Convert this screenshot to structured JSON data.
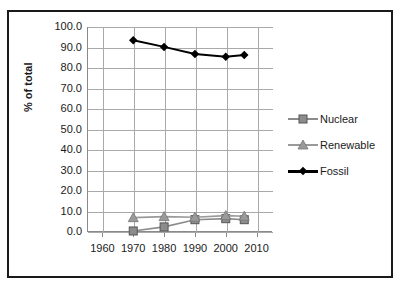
{
  "chart_data": {
    "type": "line",
    "title": "",
    "subtitle": "",
    "xlabel": "",
    "ylabel": "% of total",
    "x": [
      1970,
      1980,
      1990,
      2000,
      2006
    ],
    "xlim": [
      1955,
      2015
    ],
    "ylim": [
      0.0,
      100.0
    ],
    "xticks": [
      1960,
      1970,
      1980,
      1990,
      2000,
      2010
    ],
    "xtick_labels": [
      "1960",
      "1970",
      "1980",
      "1990",
      "2000",
      "2010"
    ],
    "yticks": [
      0.0,
      10.0,
      20.0,
      30.0,
      40.0,
      50.0,
      60.0,
      70.0,
      80.0,
      90.0,
      100.0
    ],
    "ytick_labels": [
      "0.0",
      "10.0",
      "20.0",
      "30.0",
      "40.0",
      "50.0",
      "60.0",
      "70.0",
      "80.0",
      "90.0",
      "100.0"
    ],
    "grid": true,
    "grid_axis": "both",
    "legend_position": "right",
    "series": [
      {
        "name": "Nuclear",
        "marker": "square",
        "color": "#8c8c8c",
        "line_color": "#8c8c8c",
        "values": [
          0.5,
          2.5,
          6.0,
          6.5,
          6.0
        ]
      },
      {
        "name": "Renewable",
        "marker": "triangle",
        "color": "#9a9a9a",
        "line_color": "#9a9a9a",
        "values": [
          7.0,
          7.5,
          7.2,
          8.0,
          7.7
        ]
      },
      {
        "name": "Fossil",
        "marker": "diamond",
        "color": "#000000",
        "line_color": "#000000",
        "values": [
          93.5,
          90.3,
          86.8,
          85.5,
          86.3
        ]
      }
    ]
  },
  "legend": {
    "items": [
      {
        "label": "Nuclear"
      },
      {
        "label": "Renewable"
      },
      {
        "label": "Fossil"
      }
    ]
  },
  "axes": {
    "y_title": "% of total"
  },
  "colors": {
    "frame": "#1a1a1a",
    "grid": "#a9a9a9",
    "axis": "#8a8a8a",
    "background": "#ffffff",
    "nuclear": "#8c8c8c",
    "renewable": "#9a9a9a",
    "fossil": "#000000"
  }
}
